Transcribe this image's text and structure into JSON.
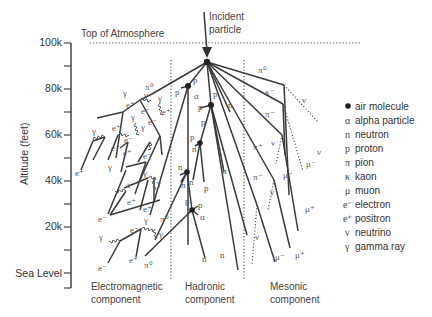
{
  "title": {
    "incident_line1": "Incident",
    "incident_line2": "particle",
    "top_of_atmosphere": "Top of Atmosphere"
  },
  "axis": {
    "label": "Altitude (feet)",
    "ticks": [
      "100k",
      "80k",
      "60k",
      "40k",
      "20k",
      "Sea Level"
    ]
  },
  "components": [
    {
      "line1": "Electromagnetic",
      "line2": "component"
    },
    {
      "line1": "Hadronic",
      "line2": "component"
    },
    {
      "line1": "Mesonic",
      "line2": "component"
    }
  ],
  "legend": [
    {
      "symbol": "●",
      "label": "air molecule"
    },
    {
      "symbol": "α",
      "label": "alpha particle"
    },
    {
      "symbol": "n",
      "label": "neutron"
    },
    {
      "symbol": "p",
      "label": "proton"
    },
    {
      "symbol": "π",
      "label": "pion"
    },
    {
      "symbol": "κ",
      "label": "kaon"
    },
    {
      "symbol": "μ",
      "label": "muon"
    },
    {
      "symbol": "e⁻",
      "label": "electron"
    },
    {
      "symbol": "e⁺",
      "label": "positron"
    },
    {
      "symbol": "ν",
      "label": "neutrino"
    },
    {
      "symbol": "γ",
      "label": "gamma ray"
    }
  ],
  "particle_labels": {
    "pi0": "π⁰",
    "pip": "π⁺",
    "pim": "π⁻",
    "km": "κ⁻",
    "mup": "μ⁺",
    "mum": "μ⁻",
    "nu": "ν",
    "ep": "e⁺",
    "em": "e⁻",
    "g": "γ",
    "p": "p",
    "n": "n",
    "a": "α"
  }
}
